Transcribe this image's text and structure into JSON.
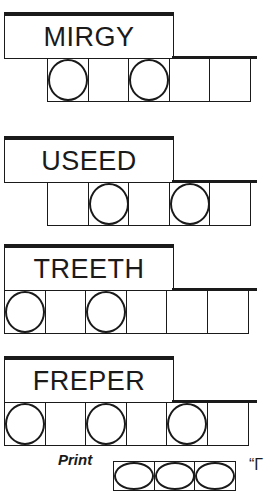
{
  "puzzles": [
    {
      "word": "MIRGY",
      "cells": 5,
      "offset_cells": 1,
      "circled": [
        0,
        2
      ]
    },
    {
      "word": "USEED",
      "cells": 5,
      "offset_cells": 1,
      "circled": [
        1,
        3
      ]
    },
    {
      "word": "TREETH",
      "cells": 6,
      "offset_cells": 0,
      "circled": [
        0,
        2
      ]
    },
    {
      "word": "FREPER",
      "cells": 6,
      "offset_cells": 0,
      "circled": [
        0,
        2,
        4
      ]
    }
  ],
  "footer": {
    "print_label": "Print",
    "answer_cells": 3,
    "quote_mark": "“Γ"
  }
}
